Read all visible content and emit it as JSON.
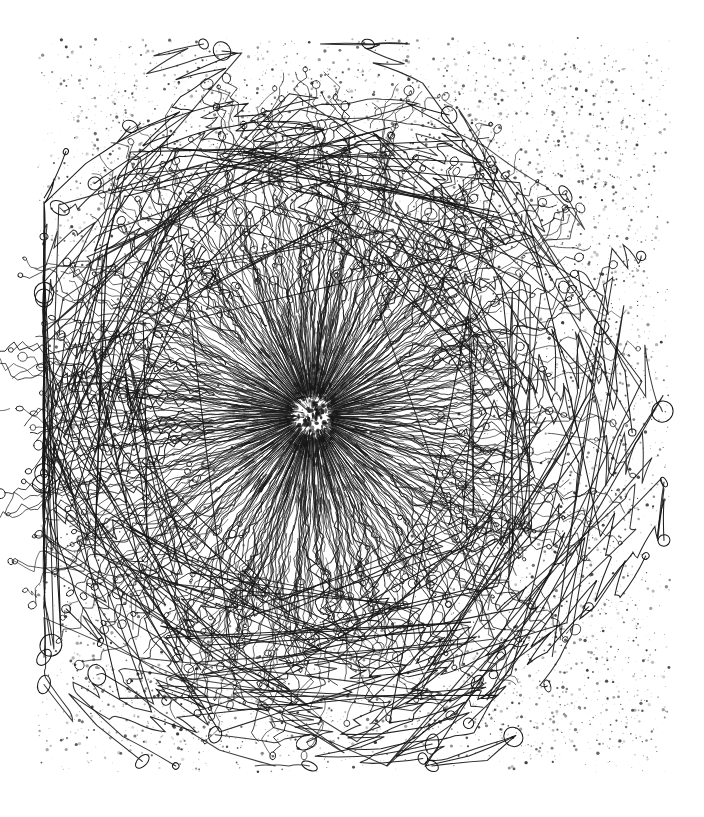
{
  "figure": {
    "kind": "scanned-ink-illustration",
    "title": "",
    "caption": "",
    "label": "",
    "has_visible_text": false,
    "background_color": "#ffffff",
    "ink_color": "#1a1a1a",
    "paper_tone": "#fefefe",
    "canvas": {
      "width": 704,
      "height": 817
    }
  },
  "plate": {
    "margin_left": 38,
    "margin_top": 38,
    "margin_right": 34,
    "margin_bottom": 45,
    "field_x0": 38,
    "field_y0": 38,
    "field_x1": 670,
    "field_y1": 772
  },
  "stipple": {
    "description": "fine ink spatter / halftone speckle field filling the plate area",
    "count": 5200,
    "min_radius": 0.35,
    "max_radius": 1.7,
    "color": "#2b2b2b",
    "opacity_min": 0.18,
    "opacity_max": 0.92,
    "seed": 20241,
    "falloff_note": "density tapers toward plate edges and is suppressed inside the organism body",
    "body_clear_radius": 215
  },
  "organism": {
    "center_x": 312,
    "center_y": 415,
    "core_radius": 26,
    "core_seed": 777,
    "core_tuft_count": 640,
    "core_tuft_len_min": 3,
    "core_tuft_len_max": 22,
    "inner_dense_radius": 125,
    "mid_radius": 250,
    "outer_radius": 330,
    "filament_count": 430,
    "filament_color": "#161616",
    "filament_width_inner": 0.72,
    "filament_width_outer": 0.95,
    "seed": 4821,
    "radial_aspect_x": 1.0,
    "radial_aspect_y": 1.04,
    "terminal_knob_ratio": 0.62,
    "knob_radius_min": 1.6,
    "knob_radius_max": 5.2,
    "branch_probability": 0.42,
    "wander_amplitude": 0.55
  },
  "appendages": {
    "description": "long curling outlying filaments reaching the plate margins",
    "count": 46,
    "seed": 9133,
    "reach_min": 300,
    "reach_max": 395,
    "loop_count_min": 1,
    "loop_count_max": 4,
    "bulb_radius_min": 3,
    "bulb_radius_max": 12
  },
  "scan_artifacts": {
    "vignette_opacity": 0.04,
    "grain_opacity": 0.05,
    "paper_speckle_count": 300
  }
}
